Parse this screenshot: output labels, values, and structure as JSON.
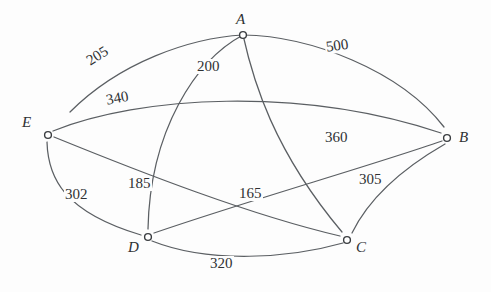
{
  "figure": {
    "kind": "weighted-undirected-graph",
    "background_color": "#fdfdfd",
    "edge_color": "#5b5f63",
    "node_stroke_color": "#3a3d40",
    "node_fill_color": "#ffffff",
    "text_color": "#2f3133"
  },
  "nodes": [
    {
      "id": "A",
      "label": "A",
      "x": 243,
      "y": 35,
      "label_x": 236,
      "label_y": 12
    },
    {
      "id": "B",
      "label": "B",
      "x": 447,
      "y": 138,
      "label_x": 459,
      "label_y": 130
    },
    {
      "id": "C",
      "label": "C",
      "x": 347,
      "y": 240,
      "label_x": 356,
      "label_y": 240
    },
    {
      "id": "D",
      "label": "D",
      "x": 148,
      "y": 237,
      "label_x": 128,
      "label_y": 240
    },
    {
      "id": "E",
      "label": "E",
      "x": 48,
      "y": 135,
      "label_x": 22,
      "label_y": 115
    }
  ],
  "edges": [
    {
      "from": "A",
      "to": "E",
      "weight": "205",
      "label_x": 83,
      "label_y": 56,
      "rotation": -32,
      "path": "M 243 35 C 190 38 120 62 70 112"
    },
    {
      "from": "A",
      "to": "B",
      "weight": "500",
      "label_x": 324,
      "label_y": 40,
      "rotation": -8,
      "path": "M 243 35 C 310 36 400 70 444 127"
    },
    {
      "from": "A",
      "to": "C",
      "weight": "200",
      "label_x": 196,
      "label_y": 59,
      "rotation": 0,
      "path": "M 243 35 C 253 80 273 150 342 232"
    },
    {
      "from": "A",
      "to": "D",
      "weight": "185",
      "label_x": 127,
      "label_y": 176,
      "rotation": 0,
      "path": "M 243 35 C 196 60 150 130 148 229"
    },
    {
      "from": "E",
      "to": "B",
      "weight": "340",
      "label_x": 104,
      "label_y": 93,
      "rotation": -10,
      "path": "M 53 131 C 140 96 300 86 441 133"
    },
    {
      "from": "E",
      "to": "C",
      "weight": "360",
      "label_x": 324,
      "label_y": 130,
      "rotation": 0,
      "path": "M 54 137 C 140 172 250 215 340 236"
    },
    {
      "from": "E",
      "to": "D",
      "weight": "302",
      "label_x": 64,
      "label_y": 187,
      "rotation": 0,
      "path": "M 47 142 C 48 178 64 212 141 235"
    },
    {
      "from": "D",
      "to": "B",
      "weight": "165",
      "label_x": 238,
      "label_y": 186,
      "rotation": 0,
      "path": "M 154 233 C 250 200 370 166 442 141"
    },
    {
      "from": "D",
      "to": "C",
      "weight": "320",
      "label_x": 209,
      "label_y": 256,
      "rotation": 0,
      "path": "M 152 241 C 210 264 290 258 343 243"
    },
    {
      "from": "B",
      "to": "C",
      "weight": "305",
      "label_x": 358,
      "label_y": 172,
      "rotation": 0,
      "path": "M 445 144 C 412 163 372 192 352 233"
    }
  ]
}
